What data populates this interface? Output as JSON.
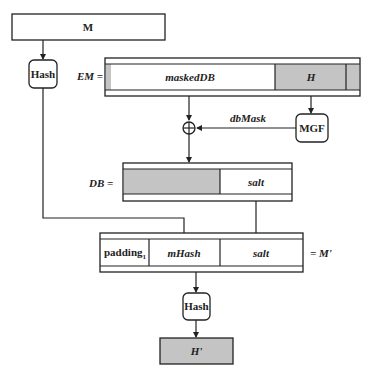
{
  "diagram": {
    "colors": {
      "stroke": "#222222",
      "shade": "#c4c4c4",
      "background": "#ffffff"
    },
    "message_box": {
      "label": "M"
    },
    "hash_top": {
      "label": "Hash"
    },
    "em": {
      "prefix": "EM =",
      "fields": [
        {
          "label": "",
          "shaded": true
        },
        {
          "label": "maskedDB",
          "shaded": false
        },
        {
          "label": "H",
          "shaded": true
        },
        {
          "label": "",
          "shaded": true
        }
      ]
    },
    "mgf": {
      "label": "MGF"
    },
    "xor": {
      "label": "⊕"
    },
    "dbmask_label": "dbMask",
    "db": {
      "prefix": "DB =",
      "fields": [
        {
          "label": "",
          "shaded": true
        },
        {
          "label": "salt",
          "shaded": false
        }
      ]
    },
    "m_prime": {
      "suffix": "= M'",
      "fields": [
        {
          "label": "padding",
          "subscript": "1"
        },
        {
          "label": "mHash"
        },
        {
          "label": "salt"
        }
      ]
    },
    "hash_bottom": {
      "label": "Hash"
    },
    "h_prime": {
      "label": "H'"
    }
  }
}
